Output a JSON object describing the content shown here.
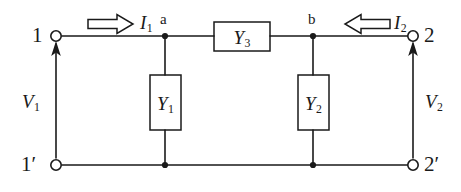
{
  "diagram": {
    "type": "circuit-schematic",
    "stroke_color": "#1a1a1a",
    "background_color": "#ffffff",
    "terminals": [
      {
        "id": "t1",
        "label": "1",
        "position": "top-left"
      },
      {
        "id": "t2",
        "label": "2",
        "position": "top-right"
      },
      {
        "id": "t1p",
        "label": "1′",
        "position": "bottom-left"
      },
      {
        "id": "t2p",
        "label": "2′",
        "position": "bottom-right"
      }
    ],
    "nodes": [
      {
        "id": "na",
        "label": "a"
      },
      {
        "id": "nb",
        "label": "b"
      }
    ],
    "components": [
      {
        "id": "y1",
        "symbol": "Y",
        "subscript": "1",
        "orientation": "vertical",
        "kind": "shunt-admittance"
      },
      {
        "id": "y2",
        "symbol": "Y",
        "subscript": "2",
        "orientation": "vertical",
        "kind": "shunt-admittance"
      },
      {
        "id": "y3",
        "symbol": "Y",
        "subscript": "3",
        "orientation": "horizontal",
        "kind": "series-admittance"
      }
    ],
    "currents": [
      {
        "id": "i1",
        "symbol": "I",
        "subscript": "1",
        "arrow": "hollow-right",
        "direction": "right"
      },
      {
        "id": "i2",
        "symbol": "I",
        "subscript": "2",
        "arrow": "hollow-left",
        "direction": "left"
      }
    ],
    "voltages": [
      {
        "id": "v1",
        "symbol": "V",
        "subscript": "1",
        "arrow": "solid-up",
        "direction": "up"
      },
      {
        "id": "v2",
        "symbol": "V",
        "subscript": "2",
        "arrow": "solid-up",
        "direction": "up"
      }
    ]
  }
}
